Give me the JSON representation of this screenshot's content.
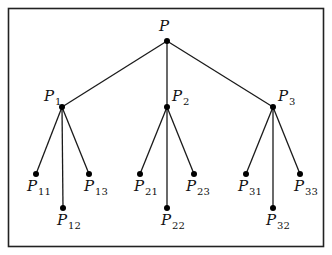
{
  "diagram": {
    "type": "tree",
    "root": {
      "id": "P",
      "label": "P",
      "sub": "",
      "x": 167,
      "y": 41,
      "lx": 159,
      "ly": 31
    },
    "level1": [
      {
        "id": "P1",
        "label": "P",
        "sub": "1",
        "x": 62,
        "y": 107,
        "lx": 44,
        "ly": 101
      },
      {
        "id": "P2",
        "label": "P",
        "sub": "2",
        "x": 167,
        "y": 107,
        "lx": 172,
        "ly": 101
      },
      {
        "id": "P3",
        "label": "P",
        "sub": "3",
        "x": 273,
        "y": 107,
        "lx": 278,
        "ly": 101
      }
    ],
    "leaves": [
      {
        "id": "P11",
        "parent": "P1",
        "label": "P",
        "sub": "11",
        "x": 36,
        "y": 174,
        "lx": 27,
        "ly": 191
      },
      {
        "id": "P12",
        "parent": "P1",
        "label": "P",
        "sub": "12",
        "x": 63,
        "y": 208,
        "lx": 57,
        "ly": 225
      },
      {
        "id": "P13",
        "parent": "P1",
        "label": "P",
        "sub": "13",
        "x": 89,
        "y": 174,
        "lx": 84,
        "ly": 191
      },
      {
        "id": "P21",
        "parent": "P2",
        "label": "P",
        "sub": "21",
        "x": 140,
        "y": 174,
        "lx": 134,
        "ly": 191
      },
      {
        "id": "P22",
        "parent": "P2",
        "label": "P",
        "sub": "22",
        "x": 167,
        "y": 208,
        "lx": 161,
        "ly": 225
      },
      {
        "id": "P23",
        "parent": "P2",
        "label": "P",
        "sub": "23",
        "x": 194,
        "y": 174,
        "lx": 186,
        "ly": 191
      },
      {
        "id": "P31",
        "parent": "P3",
        "label": "P",
        "sub": "31",
        "x": 246,
        "y": 174,
        "lx": 238,
        "ly": 191
      },
      {
        "id": "P32",
        "parent": "P3",
        "label": "P",
        "sub": "32",
        "x": 273,
        "y": 208,
        "lx": 266,
        "ly": 225
      },
      {
        "id": "P33",
        "parent": "P3",
        "label": "P",
        "sub": "33",
        "x": 300,
        "y": 174,
        "lx": 294,
        "ly": 191
      }
    ]
  }
}
